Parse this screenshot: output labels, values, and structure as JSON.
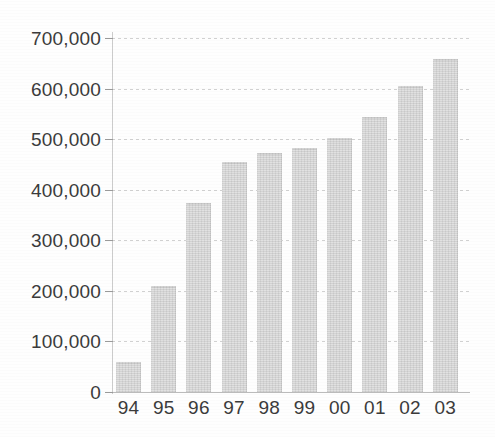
{
  "chart_data": {
    "type": "bar",
    "title": "",
    "xlabel": "",
    "ylabel": "",
    "categories": [
      "94",
      "95",
      "96",
      "97",
      "98",
      "99",
      "00",
      "01",
      "02",
      "03"
    ],
    "values": [
      60000,
      210000,
      374000,
      455000,
      473000,
      482000,
      503000,
      543000,
      605000,
      658000
    ],
    "ylim": [
      0,
      700000
    ],
    "ytick_labels": [
      "700,000",
      "600,000",
      "500,000",
      "400,000",
      "300,000",
      "200,000",
      "100,000",
      "0"
    ],
    "ytick_values": [
      700000,
      600000,
      500000,
      400000,
      300000,
      200000,
      100000,
      0
    ],
    "grid": true,
    "legend": "none",
    "bar_color": "#dbdbdb",
    "bar_edge_color": "#cfcfcf",
    "gridline_color": "#c9c9c9",
    "axis_color": "#b4b4b4",
    "text_color": "#3b3b3b",
    "background_color": "#ffffff"
  }
}
